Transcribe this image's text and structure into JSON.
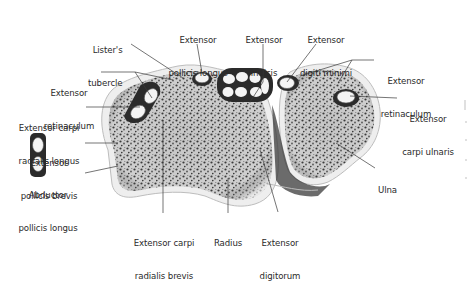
{
  "diagram": {
    "colors": {
      "background": "#ffffff",
      "label_text": "#2a2a2a",
      "leader_line": "#3a3a3a",
      "bone_fill": "#d4d4d4",
      "bone_speckle": "#3c3c3c",
      "cortex": "#ececec",
      "tendon_fill": "#f4f4f4",
      "sheath_dark": "#2b2b2b"
    },
    "labels": [
      {
        "id": "listers-tubercle",
        "line1": "Lister's",
        "line2": "tubercle"
      },
      {
        "id": "epl",
        "line1": "Extensor",
        "line2": "pollicis longus"
      },
      {
        "id": "eip",
        "line1": "Extensor",
        "line2": "indicis"
      },
      {
        "id": "edm",
        "line1": "Extensor",
        "line2": "digiti minimi"
      },
      {
        "id": "retinaculum-left",
        "line1": "Extensor",
        "line2": "retinaculum"
      },
      {
        "id": "retinaculum-right",
        "line1": "Extensor",
        "line2": "retinaculum"
      },
      {
        "id": "ecrl",
        "line1": "Extensor carpi",
        "line2": "radialis longus"
      },
      {
        "id": "ecu",
        "line1": "Extensor",
        "line2": "carpi ulnaris"
      },
      {
        "id": "epb",
        "line1": "Extensor",
        "line2": "pollicis brevis"
      },
      {
        "id": "apl",
        "line1": "Abductor",
        "line2": "pollicis longus"
      },
      {
        "id": "ecrb",
        "line1": "Extensor carpi",
        "line2": "radialis brevis"
      },
      {
        "id": "radius",
        "line1": "Radius",
        "line2": ""
      },
      {
        "id": "ed",
        "line1": "Extensor",
        "line2": "digitorum"
      },
      {
        "id": "ulna",
        "line1": "Ulna",
        "line2": ""
      }
    ]
  }
}
